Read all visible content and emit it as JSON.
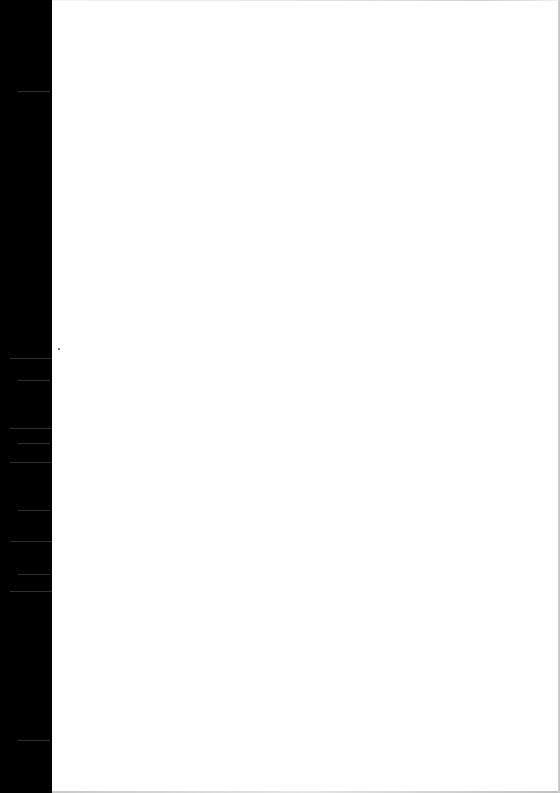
{
  "document": {
    "type": "scanned-page",
    "content": "",
    "colors": {
      "binding_strip": "#000000",
      "page_background": "#ffffff",
      "edge_shadow": "#c8c8c8"
    },
    "streaks_y": [
      91,
      358,
      380,
      428,
      443,
      462,
      510,
      541,
      574,
      591,
      740
    ],
    "specks": [
      {
        "x": 58,
        "y": 348
      }
    ]
  }
}
